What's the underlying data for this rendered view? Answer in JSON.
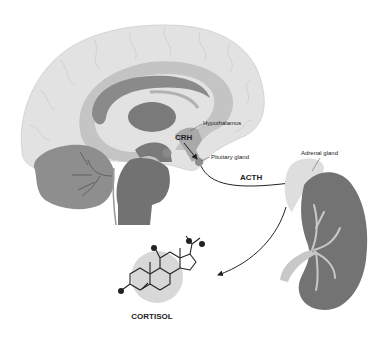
{
  "diagram": {
    "labels": {
      "hypothalamus": "Hypothalamus",
      "pituitary": "Pituitary gland",
      "adrenal": "Adrenal gland",
      "crh": "CRH",
      "acth": "ACTH",
      "cortisol": "CORTISOL"
    },
    "colors": {
      "cortex": "#e2e2e2",
      "cortex_outline": "#cfcfcf",
      "limbic_band": "#c4c4c4",
      "corpus_callosum": "#8a8a8a",
      "thalamus": "#7a7a7a",
      "cerebellum": "#8e8e8e",
      "brainstem": "#727272",
      "kidney": "#737373",
      "adrenal": "#dedede",
      "vessel": "#c8c8c8",
      "arrow": "#222222",
      "molecule_bg": "#d8d8d8"
    },
    "flow": [
      {
        "from": "hypothalamus",
        "to": "pituitary",
        "hormone": "CRH"
      },
      {
        "from": "pituitary",
        "to": "adrenal",
        "hormone": "ACTH"
      },
      {
        "from": "adrenal",
        "to": "cortisol",
        "hormone": "CORTISOL"
      }
    ]
  }
}
